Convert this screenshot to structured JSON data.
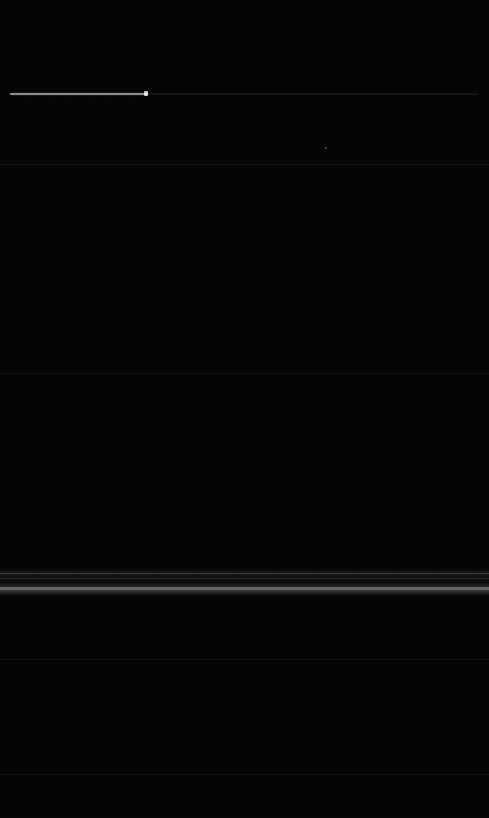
{
  "screen": {
    "width": 489,
    "height": 818,
    "background_color": "#030303",
    "state_label": "dimmed",
    "description": "Near-black dimmed screen"
  },
  "slider": {
    "name": "brightness-slider",
    "track_color": "#0e0e0e",
    "fill_color": "#858585",
    "thumb_color": "#c8c8c8",
    "value_pct": 28,
    "x": 10,
    "y": 93,
    "track_width": 469,
    "fill_width": 138
  },
  "dividers": [
    {
      "label": "divider-top",
      "y": 164,
      "color": "#131313"
    },
    {
      "label": "divider-mid",
      "y": 373,
      "color": "#101010"
    },
    {
      "label": "divider-lower",
      "y": 659,
      "color": "#101010"
    },
    {
      "label": "divider-bottom",
      "y": 774,
      "color": "#101010"
    }
  ],
  "highlight_band": {
    "name": "selected-row",
    "y": 570,
    "height": 24,
    "color": "#3a3a3a",
    "line_top_y": 573,
    "line_mid_y": 578,
    "line_bright_y": 587
  },
  "indicator_dot": {
    "name": "status-dot",
    "x": 325,
    "y": 147,
    "color": "#4d4d4d"
  },
  "regions": [
    {
      "name": "header-region",
      "y": 0,
      "height": 164,
      "color": "#030303"
    },
    {
      "name": "content-region-1",
      "y": 165,
      "height": 208,
      "color": "#030303"
    },
    {
      "name": "content-region-2",
      "y": 374,
      "height": 196,
      "color": "#040404"
    },
    {
      "name": "content-region-3",
      "y": 594,
      "height": 65,
      "color": "#030303"
    },
    {
      "name": "content-region-4",
      "y": 660,
      "height": 114,
      "color": "#030303"
    },
    {
      "name": "footer-region",
      "y": 775,
      "height": 43,
      "color": "#040404"
    }
  ],
  "labels": {
    "header_title": "",
    "slider_label": "",
    "row_primary": "",
    "row_secondary": "",
    "footer_text": ""
  }
}
